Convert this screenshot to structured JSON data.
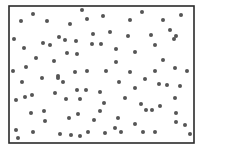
{
  "figure": {
    "frame": {
      "x": 9,
      "y": 6,
      "width": 185,
      "height": 137,
      "stroke": "#2a2a2a",
      "stroke_width": 1.6
    },
    "dot_color": "#555555",
    "dot_radius": 2.0
  },
  "chart_data": {
    "type": "scatter",
    "title": "",
    "xlabel": "",
    "ylabel": "",
    "grid": false,
    "legend": null,
    "coordinate_space": "pixel (image coordinates, origin top-left)",
    "xlim": [
      9,
      194
    ],
    "ylim": [
      6,
      143
    ],
    "points": [
      [
        21,
        21
      ],
      [
        33,
        14
      ],
      [
        47,
        21
      ],
      [
        82,
        10
      ],
      [
        70,
        24
      ],
      [
        87,
        19
      ],
      [
        103,
        16
      ],
      [
        14,
        39
      ],
      [
        43,
        43
      ],
      [
        50,
        45
      ],
      [
        59,
        37
      ],
      [
        65,
        40
      ],
      [
        76,
        41
      ],
      [
        24,
        48
      ],
      [
        93,
        34
      ],
      [
        110,
        32
      ],
      [
        92,
        44
      ],
      [
        101,
        44
      ],
      [
        67,
        53
      ],
      [
        77,
        54
      ],
      [
        36,
        58
      ],
      [
        54,
        61
      ],
      [
        26,
        67
      ],
      [
        13,
        71
      ],
      [
        58,
        76
      ],
      [
        75,
        72
      ],
      [
        87,
        71
      ],
      [
        106,
        71
      ],
      [
        142,
        12
      ],
      [
        130,
        20
      ],
      [
        163,
        20
      ],
      [
        181,
        15
      ],
      [
        128,
        36
      ],
      [
        151,
        35
      ],
      [
        174,
        39
      ],
      [
        170,
        30
      ],
      [
        176,
        36
      ],
      [
        155,
        45
      ],
      [
        135,
        52
      ],
      [
        116,
        49
      ],
      [
        116,
        62
      ],
      [
        163,
        60
      ],
      [
        130,
        72
      ],
      [
        155,
        71
      ],
      [
        175,
        68
      ],
      [
        187,
        71
      ],
      [
        22,
        82
      ],
      [
        42,
        78
      ],
      [
        58,
        78
      ],
      [
        63,
        82
      ],
      [
        55,
        93
      ],
      [
        77,
        90
      ],
      [
        86,
        90
      ],
      [
        16,
        100
      ],
      [
        25,
        97
      ],
      [
        32,
        95
      ],
      [
        66,
        99
      ],
      [
        80,
        99
      ],
      [
        100,
        92
      ],
      [
        31,
        113
      ],
      [
        44,
        111
      ],
      [
        45,
        121
      ],
      [
        69,
        118
      ],
      [
        78,
        114
      ],
      [
        94,
        120
      ],
      [
        104,
        103
      ],
      [
        100,
        111
      ],
      [
        16,
        130
      ],
      [
        18,
        138
      ],
      [
        33,
        132
      ],
      [
        60,
        134
      ],
      [
        71,
        135
      ],
      [
        80,
        136
      ],
      [
        88,
        132
      ],
      [
        105,
        133
      ],
      [
        119,
        82
      ],
      [
        145,
        79
      ],
      [
        135,
        88
      ],
      [
        167,
        85
      ],
      [
        180,
        86
      ],
      [
        125,
        98
      ],
      [
        141,
        104
      ],
      [
        159,
        84
      ],
      [
        175,
        98
      ],
      [
        160,
        106
      ],
      [
        146,
        110
      ],
      [
        152,
        110
      ],
      [
        176,
        113
      ],
      [
        118,
        118
      ],
      [
        115,
        128
      ],
      [
        121,
        132
      ],
      [
        135,
        124
      ],
      [
        176,
        122
      ],
      [
        185,
        125
      ],
      [
        143,
        132
      ],
      [
        155,
        132
      ],
      [
        190,
        134
      ]
    ]
  }
}
